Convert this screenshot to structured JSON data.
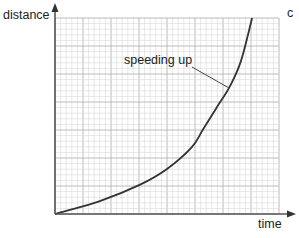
{
  "chart_data": {
    "type": "line",
    "title": "",
    "xlabel": "time",
    "ylabel": "distance",
    "xticks": [],
    "yticks": [],
    "grid": true,
    "grid_style": "graph paper: fine minor grid with major lines every 5 cells",
    "legend": null,
    "xlim": [
      0,
      10
    ],
    "ylim": [
      0,
      10
    ],
    "series": [
      {
        "name": "distance vs time",
        "x": [
          0,
          2.0,
          3.8,
          5.0,
          6.1,
          6.6,
          7.2,
          7.8,
          8.3,
          8.8
        ],
        "y": [
          0,
          0.66,
          1.5,
          2.3,
          3.4,
          4.3,
          5.4,
          6.5,
          7.8,
          10.0
        ]
      }
    ],
    "annotations": [
      {
        "text": "speeding up",
        "points_to": "curve",
        "x": 7.8,
        "y": 6.5
      }
    ],
    "cutoff_text": "c"
  },
  "labels": {
    "y_axis": "distance",
    "x_axis": "time",
    "annotation": "speeding up",
    "cutoff": "c"
  },
  "colors": {
    "axis": "#555555",
    "grid_minor": "#d6d6d6",
    "grid_major": "#b4b4b4",
    "curve": "#333333",
    "text": "#222222"
  }
}
